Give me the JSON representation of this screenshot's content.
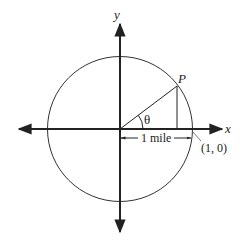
{
  "diagram": {
    "axes": {
      "x_label": "x",
      "y_label": "y"
    },
    "point_label": "P",
    "angle_label": "θ",
    "distance_label": "1 mile",
    "intercept_label": "(1, 0)",
    "colors": {
      "stroke": "#222222",
      "background": "#ffffff"
    }
  }
}
